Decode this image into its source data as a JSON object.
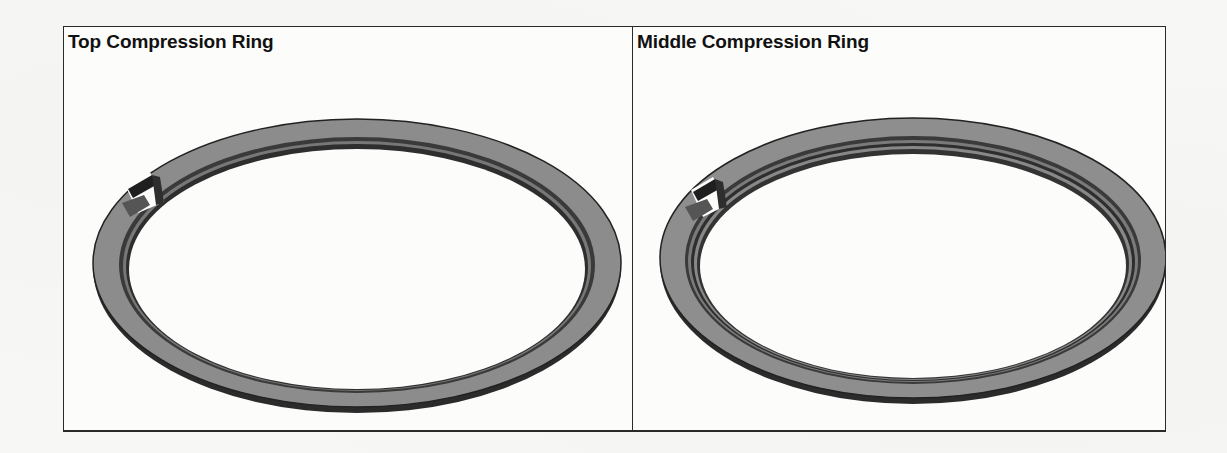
{
  "figure": {
    "panels": [
      {
        "title": "Top Compression Ring",
        "illustration": "piston-ring-top",
        "colors": {
          "face": "#8c8c8c",
          "edge": "#2b2b2b",
          "groove": "#3a3a3a"
        }
      },
      {
        "title": "Middle Compression Ring",
        "illustration": "piston-ring-middle",
        "colors": {
          "face": "#8e8e8e",
          "edge": "#2b2b2b",
          "groove": "#3a3a3a"
        }
      }
    ],
    "border_color": "#2a2a2a",
    "background": "#fcfcfb"
  }
}
